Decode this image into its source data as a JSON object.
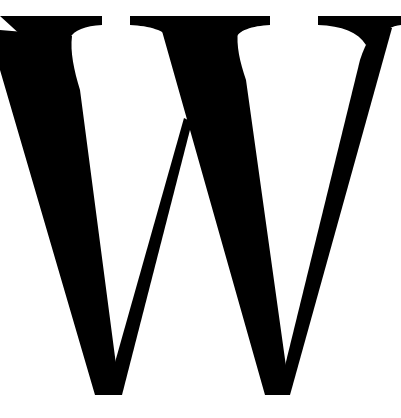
{
  "glyph": {
    "character": "W",
    "style": "serif",
    "color": "#000000",
    "background": "#ffffff"
  }
}
